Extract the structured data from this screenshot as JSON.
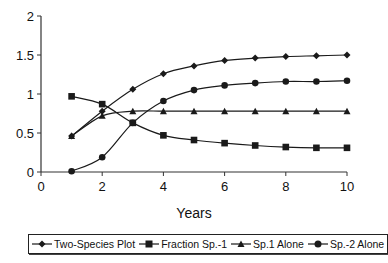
{
  "chart_data": {
    "type": "line",
    "title": "",
    "xlabel": "Years",
    "ylabel": "",
    "xlim": [
      0,
      10
    ],
    "ylim": [
      0,
      2
    ],
    "x_ticks": [
      "0",
      "2",
      "4",
      "6",
      "8",
      "10"
    ],
    "y_ticks": [
      "0",
      "0.5",
      "1",
      "1.5",
      "2"
    ],
    "grid": false,
    "legend_position": "bottom",
    "x": [
      1,
      2,
      3,
      4,
      5,
      6,
      7,
      8,
      9,
      10
    ],
    "series": [
      {
        "name": "Two-Species Plot",
        "marker": "diamond",
        "values": [
          0.46,
          0.78,
          1.06,
          1.26,
          1.36,
          1.43,
          1.46,
          1.48,
          1.49,
          1.5
        ]
      },
      {
        "name": "Fraction Sp.-1",
        "marker": "square",
        "values": [
          0.97,
          0.87,
          0.63,
          0.47,
          0.41,
          0.37,
          0.34,
          0.32,
          0.31,
          0.31
        ]
      },
      {
        "name": "Sp.1 Alone",
        "marker": "triangle",
        "values": [
          0.46,
          0.72,
          0.78,
          0.78,
          0.78,
          0.78,
          0.78,
          0.78,
          0.78,
          0.78
        ]
      },
      {
        "name": "Sp.-2 Alone",
        "marker": "circle",
        "values": [
          0.01,
          0.19,
          0.63,
          0.91,
          1.05,
          1.11,
          1.14,
          1.16,
          1.16,
          1.17
        ]
      }
    ]
  },
  "legend": {
    "items": [
      {
        "label": "Two-Species Plot",
        "icon": "diamond-marker-icon"
      },
      {
        "label": "Fraction Sp.-1",
        "icon": "square-marker-icon"
      },
      {
        "label": "Sp.1 Alone",
        "icon": "triangle-marker-icon"
      },
      {
        "label": "Sp.-2 Alone",
        "icon": "circle-marker-icon"
      }
    ]
  },
  "colors": {
    "line": "#1a1a1a",
    "axis": "#333333",
    "background": "#ffffff"
  }
}
